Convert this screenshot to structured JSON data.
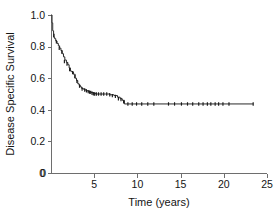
{
  "chart_data": {
    "type": "line",
    "title": "",
    "xlabel": "Time (years)",
    "ylabel": "Disease Specific Survival",
    "xlim": [
      0,
      25
    ],
    "ylim": [
      0,
      1.0
    ],
    "xticks": [
      0,
      5,
      10,
      15,
      20,
      25
    ],
    "xtick_labels": [
      "0",
      "5",
      "10",
      "15",
      "20",
      "25"
    ],
    "yticks": [
      0,
      0.2,
      0.4,
      0.6,
      0.8,
      1.0
    ],
    "ytick_labels": [
      "0",
      "0.2",
      "0.4",
      "0.6",
      "0.8",
      "1.0"
    ],
    "grid": false,
    "legend": false,
    "legend_position": "none",
    "series": [
      {
        "name": "Disease Specific Survival",
        "step": "post",
        "x": [
          0.0,
          0.12,
          0.2,
          0.3,
          0.42,
          0.55,
          0.7,
          0.85,
          1.0,
          1.15,
          1.3,
          1.45,
          1.6,
          1.78,
          1.95,
          2.1,
          2.25,
          2.4,
          2.6,
          2.8,
          2.95,
          3.1,
          3.25,
          3.4,
          3.55,
          3.75,
          3.95,
          4.15,
          4.35,
          4.6,
          4.85,
          5.15,
          5.5,
          5.9,
          6.3,
          6.8,
          7.3,
          7.7,
          8.0,
          8.25,
          8.5,
          23.4
        ],
        "y": [
          1.0,
          0.95,
          0.9,
          0.86,
          0.85,
          0.835,
          0.82,
          0.805,
          0.79,
          0.775,
          0.755,
          0.735,
          0.715,
          0.7,
          0.685,
          0.665,
          0.645,
          0.64,
          0.625,
          0.6,
          0.585,
          0.565,
          0.555,
          0.545,
          0.535,
          0.53,
          0.525,
          0.52,
          0.515,
          0.51,
          0.505,
          0.5,
          0.5,
          0.5,
          0.5,
          0.495,
          0.49,
          0.48,
          0.47,
          0.46,
          0.437,
          0.437
        ]
      }
    ],
    "censored_x": [
      0.35,
      0.62,
      0.95,
      1.25,
      1.55,
      1.85,
      2.15,
      2.5,
      2.75,
      3.0,
      3.3,
      3.6,
      3.9,
      4.1,
      4.3,
      4.45,
      4.6,
      4.75,
      4.9,
      5.05,
      5.25,
      5.5,
      5.8,
      6.1,
      6.45,
      6.8,
      7.1,
      7.45,
      7.8,
      8.1,
      8.4,
      8.9,
      9.4,
      9.9,
      10.5,
      11.2,
      11.9,
      13.6,
      14.3,
      15.1,
      15.8,
      16.4,
      17.1,
      17.6,
      18.1,
      18.5,
      19.0,
      19.4,
      19.9,
      20.6,
      23.4
    ],
    "censored_y": [
      0.87,
      0.83,
      0.79,
      0.765,
      0.705,
      0.69,
      0.655,
      0.635,
      0.61,
      0.58,
      0.55,
      0.532,
      0.525,
      0.52,
      0.515,
      0.512,
      0.51,
      0.505,
      0.502,
      0.5,
      0.5,
      0.5,
      0.5,
      0.5,
      0.5,
      0.495,
      0.49,
      0.485,
      0.47,
      0.465,
      0.45,
      0.437,
      0.437,
      0.437,
      0.437,
      0.437,
      0.437,
      0.437,
      0.437,
      0.437,
      0.437,
      0.437,
      0.437,
      0.437,
      0.437,
      0.437,
      0.437,
      0.437,
      0.437,
      0.437,
      0.437
    ],
    "colors": {
      "curve": "#2a2a2a",
      "axis": "#6e6e6e",
      "text": "#141414",
      "background": "#ffffff"
    }
  },
  "geometry": {
    "plot_left": 51,
    "plot_right": 267,
    "plot_top": 15,
    "plot_bottom": 173
  }
}
